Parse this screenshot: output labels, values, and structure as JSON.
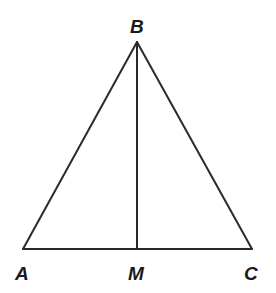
{
  "diagram": {
    "type": "triangle-with-median",
    "vertices": {
      "A": {
        "label": "A",
        "x": 23,
        "y": 249
      },
      "B": {
        "label": "B",
        "x": 137,
        "y": 42
      },
      "C": {
        "label": "C",
        "x": 252,
        "y": 249
      },
      "M": {
        "label": "M",
        "x": 137,
        "y": 249
      }
    },
    "segments": [
      {
        "from": "A",
        "to": "B"
      },
      {
        "from": "B",
        "to": "C"
      },
      {
        "from": "A",
        "to": "C"
      },
      {
        "from": "B",
        "to": "M"
      }
    ],
    "labels": {
      "A": "A",
      "B": "B",
      "C": "C",
      "M": "M"
    },
    "line_color": "#2a2a2a"
  }
}
